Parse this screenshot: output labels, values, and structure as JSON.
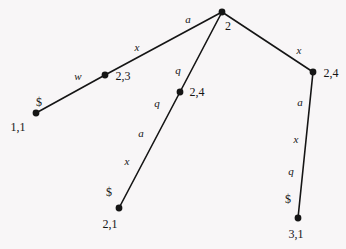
{
  "figure": {
    "type": "tree-diagram",
    "background_color": "#f8f6f7",
    "stroke_color": "#151515",
    "width": 346,
    "height": 249
  },
  "nodes": [
    {
      "id": "n_1_1",
      "label": "1,1",
      "marker": "$",
      "x": 36,
      "y": 113,
      "label_x": 18,
      "label_y": 127,
      "marker_x": 39,
      "marker_y": 102
    },
    {
      "id": "n_2_3",
      "label": "2,3",
      "marker": "",
      "x": 105,
      "y": 75,
      "label_x": 123,
      "label_y": 76,
      "marker_x": 0,
      "marker_y": 0
    },
    {
      "id": "n_root",
      "label": "2",
      "marker": "",
      "x": 222,
      "y": 12,
      "label_x": 228,
      "label_y": 26,
      "marker_x": 0,
      "marker_y": 0
    },
    {
      "id": "n_2_4m",
      "label": "2,4",
      "marker": "",
      "x": 180,
      "y": 92,
      "label_x": 197,
      "label_y": 92,
      "marker_x": 0,
      "marker_y": 0
    },
    {
      "id": "n_2_4r",
      "label": "2,4",
      "marker": "",
      "x": 313,
      "y": 72,
      "label_x": 331,
      "label_y": 73,
      "marker_x": 0,
      "marker_y": 0
    },
    {
      "id": "n_2_1",
      "label": "2,1",
      "marker": "$",
      "x": 119,
      "y": 208,
      "label_x": 110,
      "label_y": 224,
      "marker_x": 109,
      "marker_y": 192
    },
    {
      "id": "n_3_1",
      "label": "3,1",
      "marker": "$",
      "x": 298,
      "y": 218,
      "label_x": 296,
      "label_y": 234,
      "marker_x": 288,
      "marker_y": 199
    }
  ],
  "edges": [
    {
      "id": "e_11_23",
      "from": "n_1_1",
      "to": "n_2_3",
      "x1": 36,
      "y1": 113,
      "x2": 105,
      "y2": 75
    },
    {
      "id": "e_23_root",
      "from": "n_2_3",
      "to": "n_root",
      "x1": 105,
      "y1": 75,
      "x2": 222,
      "y2": 12
    },
    {
      "id": "e_root_24m",
      "from": "n_root",
      "to": "n_2_4m",
      "x1": 222,
      "y1": 12,
      "x2": 180,
      "y2": 92
    },
    {
      "id": "e_24m_21",
      "from": "n_2_4m",
      "to": "n_2_1",
      "x1": 180,
      "y1": 92,
      "x2": 119,
      "y2": 208
    },
    {
      "id": "e_root_24r",
      "from": "n_root",
      "to": "n_2_4r",
      "x1": 222,
      "y1": 12,
      "x2": 313,
      "y2": 72
    },
    {
      "id": "e_24r_31",
      "from": "n_2_4r",
      "to": "n_3_1",
      "x1": 313,
      "y1": 72,
      "x2": 298,
      "y2": 218
    }
  ],
  "edge_labels": [
    {
      "id": "el_w",
      "text": "w",
      "x": 78,
      "y": 76,
      "edge": "e_11_23"
    },
    {
      "id": "el_x1",
      "text": "x",
      "x": 137,
      "y": 47,
      "edge": "e_23_root"
    },
    {
      "id": "el_a1",
      "text": "a",
      "x": 188,
      "y": 19,
      "edge": "e_23_root"
    },
    {
      "id": "el_q1",
      "text": "q",
      "x": 178,
      "y": 70,
      "edge": "e_root_24m"
    },
    {
      "id": "el_q2",
      "text": "q",
      "x": 157,
      "y": 103,
      "edge": "e_24m_21"
    },
    {
      "id": "el_a2",
      "text": "a",
      "x": 141,
      "y": 133,
      "edge": "e_24m_21"
    },
    {
      "id": "el_x2",
      "text": "x",
      "x": 127,
      "y": 161,
      "edge": "e_24m_21"
    },
    {
      "id": "el_x3",
      "text": "x",
      "x": 299,
      "y": 50,
      "edge": "e_root_24r"
    },
    {
      "id": "el_a3",
      "text": "a",
      "x": 300,
      "y": 102,
      "edge": "e_24r_31"
    },
    {
      "id": "el_x4",
      "text": "x",
      "x": 296,
      "y": 139,
      "edge": "e_24r_31"
    },
    {
      "id": "el_q3",
      "text": "q",
      "x": 291,
      "y": 171,
      "edge": "e_24r_31"
    }
  ]
}
